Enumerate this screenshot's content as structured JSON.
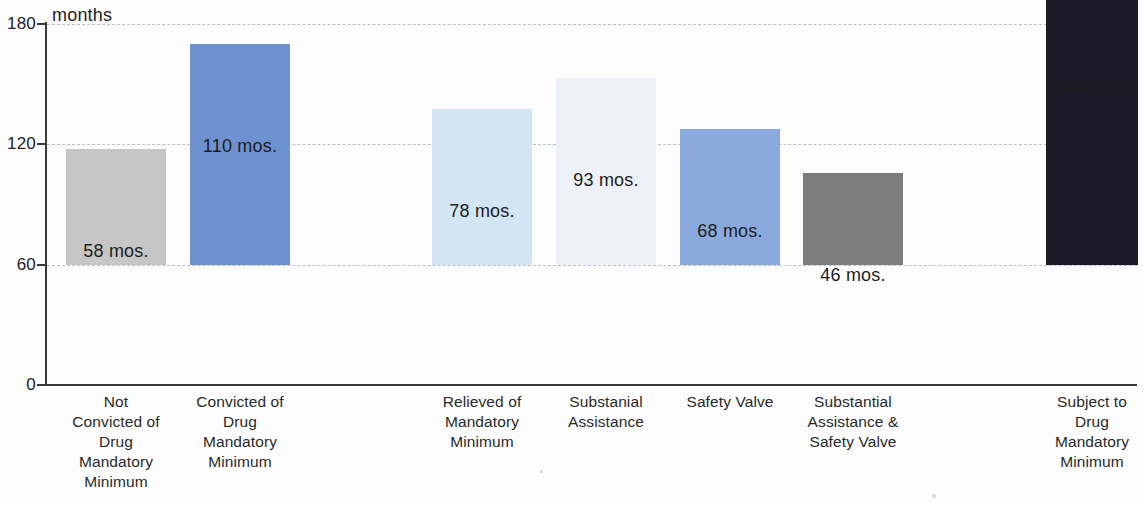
{
  "chart_data": {
    "type": "bar",
    "title": "",
    "subtitle": "",
    "xlabel": "",
    "ylabel": "months",
    "ylim": [
      0,
      180
    ],
    "grid": true,
    "legend": "none",
    "y_ticks": [
      "0",
      "60",
      "120",
      "180"
    ],
    "y_tick_values": [
      0,
      60,
      120,
      180
    ],
    "categories": [
      "Not Convicted of Drug Mandatory Minimum",
      "Convicted of Drug Mandatory Minimum",
      "Relieved of Mandatory Minimum",
      "Substanial Assistance",
      "Safety Valve",
      "Substantial Assistance & Safety Valve",
      "Subject to Drug Mandatory Minimum"
    ],
    "category_lines": [
      [
        "Not",
        "Convicted of",
        "Drug",
        "Mandatory",
        "Minimum"
      ],
      [
        "Convicted of",
        "Drug",
        "Mandatory",
        "Minimum"
      ],
      [
        "Relieved of",
        "Mandatory",
        "Minimum"
      ],
      [
        "Substanial",
        "Assistance"
      ],
      [
        "Safety Valve"
      ],
      [
        "Substantial",
        "Assistance &",
        "Safety Valve"
      ],
      [
        "Subject to",
        "Drug",
        "Mandatory",
        "Minimum"
      ]
    ],
    "values": [
      58,
      110,
      78,
      93,
      68,
      46,
      140
    ],
    "value_labels": [
      "58 mos.",
      "110 mos.",
      "78 mos.",
      "93 mos.",
      "68 mos.",
      "46 mos.",
      "140 mos."
    ],
    "colors": [
      "#c6c6c6",
      "#6d92cf",
      "#d3e5f4",
      "#edf2f8",
      "#8aaade",
      "#7d7d7d",
      "#1c1a26"
    ],
    "unit": "mos."
  },
  "axis": {
    "unit_label": "months",
    "axis_color": "#3a3a3a",
    "gridline_color": "#b9bfc7"
  }
}
